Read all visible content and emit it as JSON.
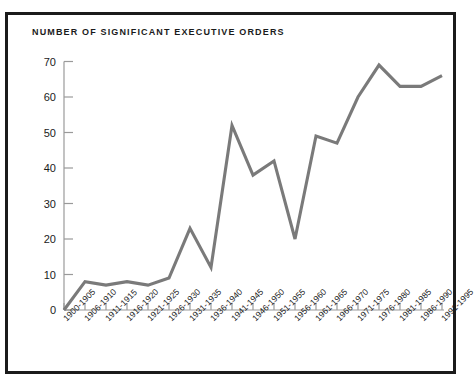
{
  "chart_data": {
    "type": "line",
    "title": "NUMBER OF SIGNIFICANT EXECUTIVE ORDERS",
    "xlabel": "",
    "ylabel": "",
    "categories": [
      "1900-1905",
      "1906-1910",
      "1911-1915",
      "1916-1920",
      "1921-1925",
      "1926-1930",
      "1931-1935",
      "1936-1940",
      "1941-1945",
      "1946-1950",
      "1951-1955",
      "1956-1960",
      "1961-1965",
      "1966-1970",
      "1971-1975",
      "1976-1980",
      "1981-1985",
      "1986-1990",
      "1991-1995"
    ],
    "values": [
      0,
      8,
      7,
      8,
      7,
      9,
      23,
      12,
      52,
      38,
      42,
      20,
      49,
      47,
      60,
      69,
      63,
      63,
      66
    ],
    "ytick_labels": [
      "0",
      "10",
      "20",
      "30",
      "40",
      "50",
      "60",
      "70"
    ],
    "ytick_values": [
      0,
      10,
      20,
      30,
      40,
      50,
      60,
      70
    ],
    "ylim": [
      0,
      73
    ],
    "grid": false,
    "legend": false,
    "line_color": "#7a7a7a",
    "axis_color": "#9a9a9a",
    "text_color": "#1b1b1b",
    "border_color": "#1b1b1b",
    "background_color": "#ffffff"
  }
}
